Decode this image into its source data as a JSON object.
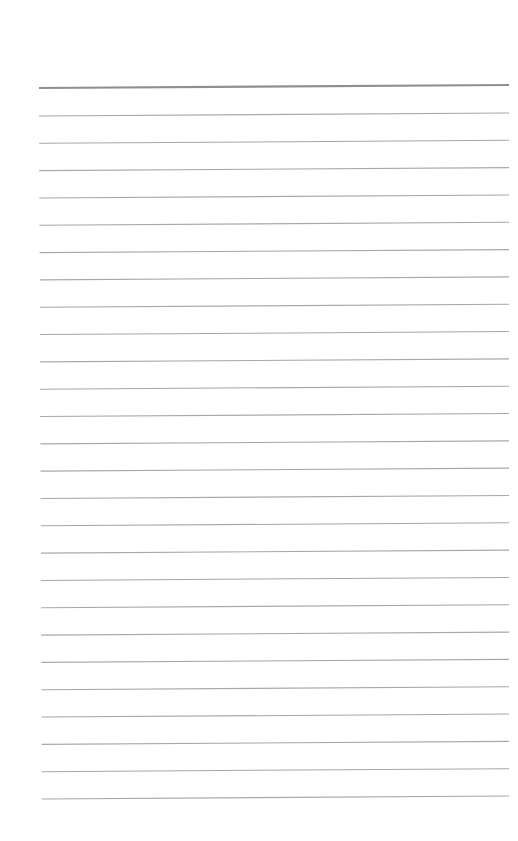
{
  "page": {
    "type": "lined-notebook-page",
    "background_color": "#ffffff",
    "line_color": "#a8a8a8",
    "header_line_color": "#8f8f8f",
    "header_line_y": 88,
    "header_line_thickness": 2.2,
    "line_thickness": 1.1,
    "first_line_y": 116,
    "line_spacing": 27.32,
    "line_count": 26,
    "left_x": 39,
    "right_x": 509,
    "tilt_px": -3
  }
}
